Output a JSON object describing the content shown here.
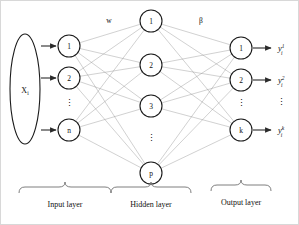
{
  "figure": {
    "background_color": "#ffffff",
    "line_color": "#8a8a8a",
    "node_stroke_color": "#1a1a1a",
    "arrow_color": "#2b2b2b"
  },
  "input_source": {
    "label_base": "X",
    "label_subscript": "i"
  },
  "weights": {
    "input_to_hidden": "w",
    "hidden_to_output": "β"
  },
  "layers": {
    "input": {
      "caption": "Input layer",
      "nodes": [
        "1",
        "2",
        "n"
      ],
      "ellipsis": "⋮"
    },
    "hidden": {
      "caption": "Hidden layer",
      "nodes": [
        "1",
        "2",
        "3",
        "p"
      ],
      "ellipsis": "⋮"
    },
    "output": {
      "caption": "Output layer",
      "nodes": [
        "1",
        "2",
        "k"
      ],
      "ellipsis": "⋮"
    }
  },
  "outputs": [
    {
      "base": "y",
      "subscript": "i",
      "superscript": "1"
    },
    {
      "base": "y",
      "subscript": "i",
      "superscript": "2"
    },
    {
      "base": "y",
      "subscript": "i",
      "superscript": "k"
    }
  ],
  "output_ellipsis": "⋮",
  "geometry": {
    "input_x": 68,
    "hidden_x": 150,
    "output_x": 240,
    "input_node_y": [
      45,
      77,
      129
    ],
    "hidden_node_y": [
      20,
      64,
      105,
      172
    ],
    "output_node_y": [
      47,
      79,
      129
    ],
    "node_radius": 11,
    "ellipse_cx": 24,
    "ellipse_cy": 88,
    "ellipse_rx": 15,
    "ellipse_ry": 55
  }
}
